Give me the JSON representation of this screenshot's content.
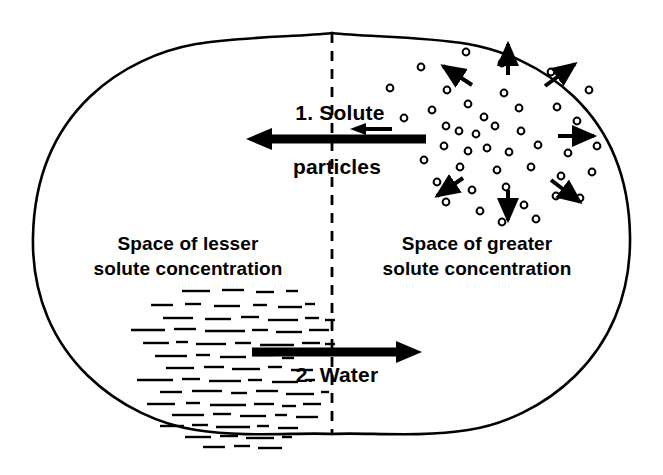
{
  "diagram": {
    "background_color": "#ffffff",
    "ink_color": "#000000",
    "labels": {
      "step1_line1": "1. Solute",
      "step1_line2": "particles",
      "step2": "2. Water",
      "left_region_line1": "Space of lesser",
      "left_region_line2": "solute concentration",
      "right_region_line1": "Space of greater",
      "right_region_line2": "solute concentration"
    },
    "membrane": {
      "name": "membrane-dashed-line",
      "orientation": "vertical",
      "x": 332,
      "y_top": 33,
      "y_bottom": 434,
      "dash_pattern": "9 7",
      "stroke_width": 2.6
    },
    "lobes": [
      {
        "name": "left-lobe",
        "cx": 185,
        "cy": 236,
        "rx": 152,
        "ry": 200
      },
      {
        "name": "right-lobe",
        "cx": 478,
        "cy": 236,
        "rx": 152,
        "ry": 200
      }
    ],
    "arrows": {
      "solute_main": {
        "name": "solute-flow-arrow",
        "direction": "left",
        "x_tail": 426,
        "x_head": 248,
        "y": 139,
        "thickness": 9
      },
      "solute_small": {
        "name": "solute-small-arrow",
        "direction": "left",
        "x_tail": 392,
        "x_head": 352,
        "y": 129,
        "thickness": 4
      },
      "water_main": {
        "name": "water-flow-arrow",
        "direction": "right",
        "x_tail": 252,
        "x_head": 422,
        "y": 352,
        "thickness": 9
      }
    },
    "solute_particles": {
      "name": "solute-particle-field",
      "shape": "open-circle",
      "radius": 3.4,
      "stroke_width": 2,
      "count": 43,
      "points": [
        [
          466,
          52
        ],
        [
          421,
          67
        ],
        [
          502,
          63
        ],
        [
          551,
          72
        ],
        [
          390,
          88
        ],
        [
          447,
          90
        ],
        [
          589,
          90
        ],
        [
          432,
          110
        ],
        [
          468,
          104
        ],
        [
          484,
          117
        ],
        [
          504,
          93
        ],
        [
          519,
          108
        ],
        [
          557,
          107
        ],
        [
          404,
          118
        ],
        [
          446,
          126
        ],
        [
          459,
          131
        ],
        [
          476,
          134
        ],
        [
          495,
          126
        ],
        [
          521,
          131
        ],
        [
          577,
          121
        ],
        [
          444,
          146
        ],
        [
          468,
          151
        ],
        [
          487,
          148
        ],
        [
          509,
          152
        ],
        [
          538,
          145
        ],
        [
          568,
          153
        ],
        [
          597,
          146
        ],
        [
          424,
          160
        ],
        [
          460,
          167
        ],
        [
          497,
          170
        ],
        [
          531,
          167
        ],
        [
          561,
          176
        ],
        [
          592,
          172
        ],
        [
          437,
          182
        ],
        [
          472,
          190
        ],
        [
          506,
          187
        ],
        [
          446,
          202
        ],
        [
          524,
          205
        ],
        [
          556,
          196
        ],
        [
          580,
          198
        ],
        [
          480,
          211
        ],
        [
          502,
          222
        ],
        [
          536,
          219
        ]
      ]
    },
    "radiating_arrows": {
      "name": "solute-diffusion-arrows",
      "count": 8,
      "vectors": [
        {
          "x1": 508,
          "y1": 75,
          "x2": 508,
          "y2": 44,
          "label": "up"
        },
        {
          "x1": 472,
          "y1": 85,
          "x2": 443,
          "y2": 66,
          "label": "up-left"
        },
        {
          "x1": 545,
          "y1": 86,
          "x2": 575,
          "y2": 64,
          "label": "up-right"
        },
        {
          "x1": 558,
          "y1": 136,
          "x2": 594,
          "y2": 136,
          "label": "right"
        },
        {
          "x1": 463,
          "y1": 178,
          "x2": 437,
          "y2": 196,
          "label": "down-left"
        },
        {
          "x1": 551,
          "y1": 180,
          "x2": 580,
          "y2": 202,
          "label": "down-right"
        },
        {
          "x1": 508,
          "y1": 190,
          "x2": 508,
          "y2": 220,
          "label": "down"
        }
      ]
    },
    "water_dashes": {
      "name": "water-molecule-field",
      "shape": "short-horizontal-dash",
      "stroke_width": 2.4,
      "count": 74,
      "segments": [
        [
          182,
          291,
          28
        ],
        [
          222,
          290,
          22
        ],
        [
          256,
          292,
          18
        ],
        [
          286,
          291,
          12
        ],
        [
          151,
          305,
          22
        ],
        [
          185,
          304,
          16
        ],
        [
          214,
          306,
          26
        ],
        [
          253,
          305,
          14
        ],
        [
          278,
          307,
          24
        ],
        [
          305,
          304,
          10
        ],
        [
          163,
          318,
          30
        ],
        [
          205,
          319,
          26
        ],
        [
          241,
          317,
          18
        ],
        [
          268,
          320,
          30
        ],
        [
          305,
          318,
          14
        ],
        [
          325,
          320,
          10
        ],
        [
          131,
          330,
          34
        ],
        [
          174,
          329,
          22
        ],
        [
          205,
          331,
          40
        ],
        [
          252,
          330,
          16
        ],
        [
          276,
          332,
          26
        ],
        [
          309,
          330,
          20
        ],
        [
          143,
          343,
          26
        ],
        [
          176,
          342,
          12
        ],
        [
          196,
          344,
          30
        ],
        [
          235,
          343,
          16
        ],
        [
          260,
          345,
          34
        ],
        [
          302,
          343,
          18
        ],
        [
          325,
          344,
          10
        ],
        [
          155,
          356,
          32
        ],
        [
          196,
          355,
          14
        ],
        [
          220,
          357,
          26
        ],
        [
          253,
          355,
          20
        ],
        [
          282,
          358,
          12
        ],
        [
          166,
          368,
          28
        ],
        [
          204,
          367,
          20
        ],
        [
          232,
          369,
          28
        ],
        [
          268,
          367,
          14
        ],
        [
          291,
          370,
          22
        ],
        [
          137,
          380,
          36
        ],
        [
          182,
          379,
          18
        ],
        [
          209,
          381,
          32
        ],
        [
          248,
          380,
          14
        ],
        [
          272,
          382,
          26
        ],
        [
          305,
          380,
          10
        ],
        [
          160,
          392,
          22
        ],
        [
          192,
          391,
          30
        ],
        [
          231,
          393,
          16
        ],
        [
          256,
          391,
          22
        ],
        [
          286,
          394,
          28
        ],
        [
          321,
          392,
          8
        ],
        [
          147,
          404,
          28
        ],
        [
          186,
          403,
          14
        ],
        [
          210,
          405,
          36
        ],
        [
          254,
          404,
          20
        ],
        [
          282,
          406,
          14
        ],
        [
          303,
          404,
          18
        ],
        [
          172,
          415,
          32
        ],
        [
          213,
          414,
          18
        ],
        [
          240,
          416,
          26
        ],
        [
          275,
          415,
          12
        ],
        [
          296,
          417,
          22
        ],
        [
          160,
          426,
          24
        ],
        [
          192,
          425,
          16
        ],
        [
          216,
          427,
          34
        ],
        [
          257,
          426,
          12
        ],
        [
          278,
          428,
          20
        ],
        [
          185,
          437,
          26
        ],
        [
          220,
          436,
          18
        ],
        [
          246,
          438,
          28
        ],
        [
          282,
          437,
          10
        ],
        [
          203,
          447,
          22
        ],
        [
          234,
          446,
          16
        ],
        [
          258,
          448,
          24
        ]
      ]
    }
  }
}
